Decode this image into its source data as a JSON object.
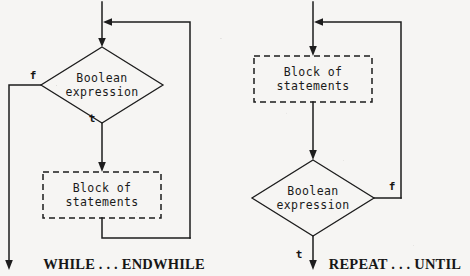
{
  "figure": {
    "type": "flowchart-pair",
    "background_color": "#f6f5f3",
    "line_color": "#1d1d1d"
  },
  "diagrams": [
    {
      "id": "while-endwhile",
      "caption": "WHILE . . . ENDWHILE",
      "decision": {
        "line1": "Boolean",
        "line2": "expression"
      },
      "process": {
        "line1": "Block of",
        "line2": "statements"
      },
      "branches": {
        "false_label": "f",
        "true_label": "t"
      },
      "notes": "Entry arrow at top joins a loop-back line from the right; decision is tested first; 'f' exits left and down; 't' leads into the dashed block which loops back up to the top."
    },
    {
      "id": "repeat-until",
      "caption": "REPEAT . . . UNTIL",
      "decision": {
        "line1": "Boolean",
        "line2": "expression"
      },
      "process": {
        "line1": "Block of",
        "line2": "statements"
      },
      "branches": {
        "false_label": "f",
        "true_label": "t"
      },
      "notes": "Entry arrow at top joins a loop-back line from the right; the dashed block runs first, then the decision is tested; 'f' loops back up to the top via the right line; 't' exits downward."
    }
  ]
}
